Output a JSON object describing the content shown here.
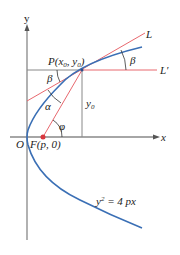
{
  "diagram": {
    "equation": {
      "base": "y",
      "exp": "2",
      "rest": " = 4 px"
    },
    "axes": {
      "x_label": "x",
      "y_label": "y",
      "origin_label": "O"
    },
    "points": {
      "P": {
        "name": "P",
        "open": "(",
        "x": "x",
        "x_sub": "0",
        "sep": ", ",
        "y": "y",
        "y_sub": "0",
        "close": ")"
      },
      "F": {
        "label": "F(p, 0)"
      }
    },
    "lines": {
      "tangent": "L",
      "horizontal": "L′"
    },
    "measures": {
      "y0": {
        "base": "y",
        "sub": "0"
      }
    },
    "angles": {
      "beta_top": "β",
      "beta_left": "β",
      "alpha": "α",
      "phi": "φ"
    },
    "colors": {
      "parabola": "#3a6fb5",
      "red_lines": "#e8686e",
      "axes": "#888888",
      "focus": "#d9363e",
      "text": "#222222"
    }
  }
}
